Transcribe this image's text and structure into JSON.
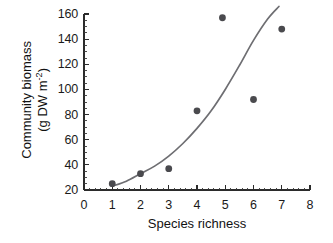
{
  "chart_data": {
    "type": "scatter",
    "title": "",
    "xlabel": "Species richness",
    "ylabel_line1": "Community biomass",
    "ylabel_line2_prefix": "(g DW m",
    "ylabel_line2_exponent": "-2",
    "ylabel_line2_suffix": ")",
    "xlim": [
      0,
      8
    ],
    "ylim": [
      20,
      160
    ],
    "x_ticks": [
      0,
      1,
      2,
      3,
      4,
      5,
      6,
      7,
      8
    ],
    "x_tick_labels": [
      "0",
      "1",
      "2",
      "3",
      "4",
      "5",
      "6",
      "7",
      "8"
    ],
    "y_ticks": [
      20,
      40,
      60,
      80,
      100,
      120,
      140,
      160
    ],
    "y_tick_labels": [
      "20",
      "40",
      "60",
      "80",
      "100",
      "120",
      "140",
      "160"
    ],
    "x_minor_ticks_per_interval": 5,
    "y_minor_ticks_per_interval": 4,
    "grid": false,
    "legend": "none",
    "series": [
      {
        "name": "observations",
        "marker": "filled-circle",
        "color": "#4a4a4e",
        "points": [
          {
            "x": 1.0,
            "y": 25
          },
          {
            "x": 2.0,
            "y": 33
          },
          {
            "x": 3.0,
            "y": 37
          },
          {
            "x": 4.0,
            "y": 83
          },
          {
            "x": 4.9,
            "y": 157
          },
          {
            "x": 6.0,
            "y": 92
          },
          {
            "x": 7.0,
            "y": 148
          }
        ]
      },
      {
        "name": "fitted-curve",
        "marker": "none",
        "color": "#6e6e72",
        "points": [
          {
            "x": 1.0,
            "y": 23
          },
          {
            "x": 1.5,
            "y": 27
          },
          {
            "x": 2.0,
            "y": 33
          },
          {
            "x": 2.5,
            "y": 39
          },
          {
            "x": 3.0,
            "y": 47
          },
          {
            "x": 3.5,
            "y": 57
          },
          {
            "x": 4.0,
            "y": 69
          },
          {
            "x": 4.5,
            "y": 83
          },
          {
            "x": 5.0,
            "y": 100
          },
          {
            "x": 5.5,
            "y": 119
          },
          {
            "x": 6.0,
            "y": 139
          },
          {
            "x": 6.5,
            "y": 156
          },
          {
            "x": 6.9,
            "y": 166
          }
        ]
      }
    ]
  },
  "axes": {
    "x_title": "Species richness",
    "y_title_line1": "Community biomass",
    "y_title_line2": "(g DW m-2)"
  }
}
